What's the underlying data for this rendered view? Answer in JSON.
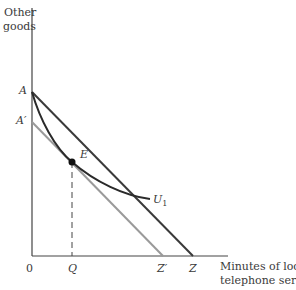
{
  "axes": {
    "y_label_line1": "Other",
    "y_label_line2": "goods",
    "x_label_line1": "Minutes of local",
    "x_label_line2": "telephone service",
    "origin": "0"
  },
  "points": {
    "A": "A",
    "A_prime": "A′",
    "E": "E",
    "Q": "Q",
    "Z_prime": "Z′",
    "Z": "Z",
    "U1": "U",
    "U1_sub": "1"
  },
  "colors": {
    "axis": "#444444",
    "budget_line_AZ": "#3a3a3a",
    "budget_line_ApZp": "#9a9a9a",
    "indifference_curve": "#2a2a2a",
    "point_E": "#111111"
  }
}
